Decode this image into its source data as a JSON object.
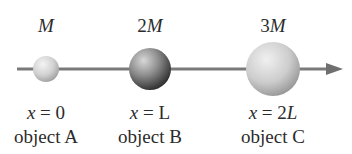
{
  "diagram": {
    "axis": {
      "direction": "positive x (arrow to the right)",
      "color": "#7a7a7a"
    },
    "objects": [
      {
        "id": "A",
        "label": "object A",
        "mass_coef": "",
        "mass_var": "M",
        "pos_prefix": "x",
        "pos_eq": " = ",
        "pos_value": "0",
        "pos_italic": false,
        "cx": 46,
        "r": 13,
        "shade_dark": "#9a9a9a"
      },
      {
        "id": "B",
        "label": "object B",
        "mass_coef": "2",
        "mass_var": "M",
        "pos_prefix": "x",
        "pos_eq": " = ",
        "pos_value": "L",
        "pos_italic": false,
        "cx": 150,
        "r": 21,
        "shade_dark": "#2e2e2e"
      },
      {
        "id": "C",
        "label": "object C",
        "mass_coef": "3",
        "mass_var": "M",
        "pos_prefix": "x",
        "pos_eq": " = 2",
        "pos_value": "L",
        "pos_italic": true,
        "cx": 273,
        "r": 27,
        "shade_dark": "#8a8a8a"
      }
    ]
  }
}
